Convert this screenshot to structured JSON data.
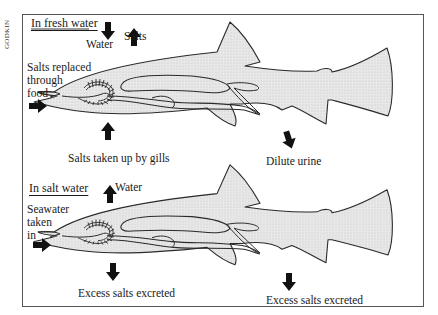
{
  "credit": "GODKIN",
  "colors": {
    "fish_fill": "#e6e6e6",
    "outline": "#2a2a2a",
    "arrow": "#111111",
    "frame": "#555555"
  },
  "panels": [
    {
      "heading": "In fresh water",
      "labels": {
        "water": "Water",
        "salts": "Salts",
        "salts_food_1": "Salts replaced",
        "salts_food_2": "through",
        "salts_food_3": "food",
        "gills": "Salts taken up by gills",
        "urine": "Dilute urine"
      },
      "arrows": [
        {
          "name": "water-in-arrow",
          "direction": "down"
        },
        {
          "name": "salts-out-arrow",
          "direction": "up"
        },
        {
          "name": "food-in-arrow",
          "direction": "right"
        },
        {
          "name": "gills-in-arrow",
          "direction": "up"
        },
        {
          "name": "urine-out-arrow",
          "direction": "down"
        }
      ]
    },
    {
      "heading": "In salt water",
      "labels": {
        "water": "Water",
        "seawater_1": "Seawater",
        "seawater_2": "taken",
        "seawater_3": "in",
        "gill_excrete": "Excess salts excreted",
        "kidney_excrete": "Excess salts excreted"
      },
      "arrows": [
        {
          "name": "water-out-arrow",
          "direction": "up"
        },
        {
          "name": "seawater-in-arrow",
          "direction": "right"
        },
        {
          "name": "gill-salts-out-arrow",
          "direction": "down"
        },
        {
          "name": "kidney-salts-out-arrow",
          "direction": "down"
        }
      ]
    }
  ]
}
